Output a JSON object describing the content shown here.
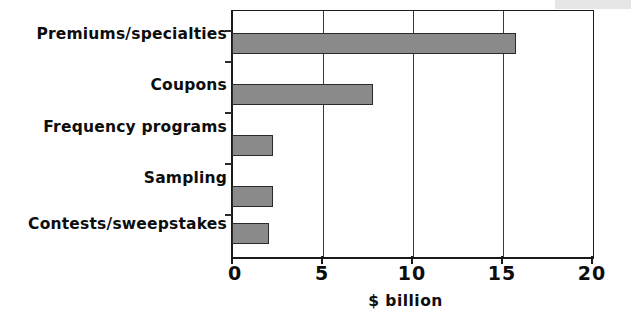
{
  "chart_data": {
    "type": "bar",
    "orientation": "horizontal",
    "title": "",
    "subtitle": "",
    "xlabel": "$ billion",
    "ylabel": "",
    "categories": [
      "Premiums/specialties",
      "Coupons",
      "Frequency programs",
      "Sampling",
      "Contests/sweepstakes"
    ],
    "values": [
      15.7,
      7.8,
      2.2,
      2.2,
      2.0
    ],
    "xlim": [
      0,
      20
    ],
    "xticks": [
      0,
      5,
      10,
      15,
      20
    ],
    "xtick_labels": [
      "0",
      "5",
      "10",
      "15",
      "20"
    ],
    "grid": "vertical",
    "legend": "none",
    "bar_color": "#8a8a8a",
    "bar_border_color": "#2b2b2b",
    "axis_color": "#1a1a1a",
    "background_color": "#ffffff"
  },
  "axis": {
    "x_title": "$ billion",
    "ticks": [
      {
        "label": "0",
        "value": 0
      },
      {
        "label": "5",
        "value": 5
      },
      {
        "label": "10",
        "value": 10
      },
      {
        "label": "15",
        "value": 15
      },
      {
        "label": "20",
        "value": 20
      }
    ]
  },
  "bars": [
    {
      "label": "Premiums/specialties",
      "value": 15.7
    },
    {
      "label": "Coupons",
      "value": 7.8
    },
    {
      "label": "Frequency programs",
      "value": 2.2
    },
    {
      "label": "Sampling",
      "value": 2.2
    },
    {
      "label": "Contests/sweepstakes",
      "value": 2.0
    }
  ]
}
